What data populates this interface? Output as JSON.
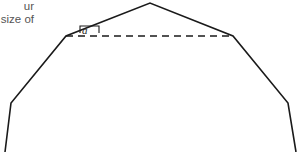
{
  "figure": {
    "background_color": "#ffffff",
    "stroke_color": "#1a1a1a",
    "caption": {
      "color": "#555555",
      "lines": [
        "ur",
        "size of"
      ]
    },
    "angle_label": {
      "text": "a",
      "x": 86,
      "y": 31
    },
    "solid_outline": {
      "name": "roof-outline",
      "points": "5,152 11,103 66,36 150,3 233,36 288,103 296,152",
      "stroke_width": 1.6
    },
    "dashed_chord": {
      "name": "horizontal-chord",
      "x1": 66,
      "y1": 36,
      "x2": 233,
      "y2": 36,
      "dash_pattern": "7,5",
      "stroke_width": 1.6
    },
    "angle_marker": {
      "name": "angle-marker-box",
      "points": "80,33 80,26 99,26 99,33"
    },
    "vertices": [
      {
        "label": "bottom-left",
        "x": 5,
        "y": 152
      },
      {
        "label": "left-eave",
        "x": 11,
        "y": 103
      },
      {
        "label": "left-ridge-base",
        "x": 66,
        "y": 36
      },
      {
        "label": "apex",
        "x": 150,
        "y": 3
      },
      {
        "label": "right-ridge-base",
        "x": 233,
        "y": 36
      },
      {
        "label": "right-eave",
        "x": 288,
        "y": 103
      },
      {
        "label": "bottom-right",
        "x": 296,
        "y": 152
      }
    ]
  }
}
